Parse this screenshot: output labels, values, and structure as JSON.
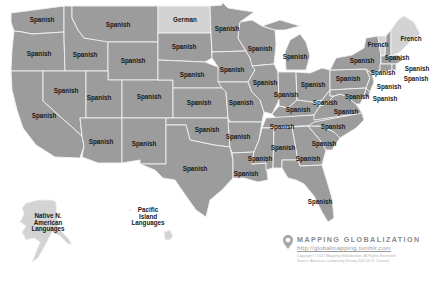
{
  "map": {
    "subject": "Most common language spoken at home other than English, by U.S. state",
    "colors": {
      "spanish_fill": "#9c9c9c",
      "other_fill": "#d3d3d3",
      "border": "#f2f2f2",
      "label": "#1a1a1a"
    },
    "states": [
      {
        "id": "WA",
        "label": "Spanish",
        "x": 42,
        "y": 20
      },
      {
        "id": "OR",
        "label": "Spanish",
        "x": 39,
        "y": 54
      },
      {
        "id": "CA",
        "label": "Spanish",
        "x": 44,
        "y": 116
      },
      {
        "id": "ID",
        "label": "Spanish",
        "x": 85,
        "y": 55
      },
      {
        "id": "NV",
        "label": "Spanish",
        "x": 66,
        "y": 91
      },
      {
        "id": "MT",
        "label": "Spanish",
        "x": 118,
        "y": 25
      },
      {
        "id": "WY",
        "label": "Spanish",
        "x": 133,
        "y": 61
      },
      {
        "id": "UT",
        "label": "Spanish",
        "x": 99,
        "y": 98
      },
      {
        "id": "CO",
        "label": "Spanish",
        "x": 149,
        "y": 97
      },
      {
        "id": "AZ",
        "label": "Spanish",
        "x": 101,
        "y": 142
      },
      {
        "id": "NM",
        "label": "Spanish",
        "x": 144,
        "y": 144
      },
      {
        "id": "ND",
        "label": "German",
        "x": 185,
        "y": 20
      },
      {
        "id": "SD",
        "label": "Spanish",
        "x": 184,
        "y": 47
      },
      {
        "id": "NE",
        "label": "Spanish",
        "x": 192,
        "y": 75
      },
      {
        "id": "KS",
        "label": "Spanish",
        "x": 199,
        "y": 103
      },
      {
        "id": "OK",
        "label": "Spanish",
        "x": 207,
        "y": 130
      },
      {
        "id": "TX",
        "label": "Spanish",
        "x": 195,
        "y": 169
      },
      {
        "id": "MN",
        "label": "Spanish",
        "x": 227,
        "y": 29
      },
      {
        "id": "IA",
        "label": "Spanish",
        "x": 232,
        "y": 70
      },
      {
        "id": "MO",
        "label": "Spanish",
        "x": 241,
        "y": 103
      },
      {
        "id": "AR",
        "label": "Spanish",
        "x": 238,
        "y": 137
      },
      {
        "id": "LA",
        "label": "Spanish",
        "x": 246,
        "y": 174
      },
      {
        "id": "WI",
        "label": "Spanish",
        "x": 260,
        "y": 49
      },
      {
        "id": "IL",
        "label": "Spanish",
        "x": 265,
        "y": 83
      },
      {
        "id": "MI",
        "label": "Spanish",
        "x": 295,
        "y": 57
      },
      {
        "id": "IN",
        "label": "Spanish",
        "x": 286,
        "y": 95
      },
      {
        "id": "OH",
        "label": "Spanish",
        "x": 313,
        "y": 85
      },
      {
        "id": "KY",
        "label": "Spanish",
        "x": 298,
        "y": 110
      },
      {
        "id": "TN",
        "label": "Spanish",
        "x": 282,
        "y": 127
      },
      {
        "id": "MS",
        "label": "Spanish",
        "x": 260,
        "y": 159
      },
      {
        "id": "AL",
        "label": "Spanish",
        "x": 283,
        "y": 148
      },
      {
        "id": "GA",
        "label": "Spanish",
        "x": 308,
        "y": 159
      },
      {
        "id": "FL",
        "label": "Spanish",
        "x": 320,
        "y": 202
      },
      {
        "id": "SC",
        "label": "Spanish",
        "x": 324,
        "y": 144
      },
      {
        "id": "NC",
        "label": "Spanish",
        "x": 333,
        "y": 127
      },
      {
        "id": "VA",
        "label": "Spanish",
        "x": 346,
        "y": 112
      },
      {
        "id": "WV",
        "label": "Spanish",
        "x": 325,
        "y": 103
      },
      {
        "id": "PA",
        "label": "Spanish",
        "x": 348,
        "y": 79
      },
      {
        "id": "NY",
        "label": "Spanish",
        "x": 362,
        "y": 61
      },
      {
        "id": "NY-north",
        "label": "French",
        "x": 378,
        "y": 45
      },
      {
        "id": "VT",
        "label": "French",
        "x": 378,
        "y": 45
      },
      {
        "id": "ME",
        "label": "French",
        "x": 411,
        "y": 39
      },
      {
        "id": "NH",
        "label": "Spanish",
        "x": 397,
        "y": 58
      },
      {
        "id": "MA",
        "label": "Spanish",
        "x": 417,
        "y": 69
      },
      {
        "id": "RI",
        "label": "Spanish",
        "x": 416,
        "y": 79
      },
      {
        "id": "CT",
        "label": "Spanish",
        "x": 383,
        "y": 73
      },
      {
        "id": "NJ",
        "label": "Spanish",
        "x": 389,
        "y": 87
      },
      {
        "id": "DE",
        "label": "Spanish",
        "x": 385,
        "y": 99
      },
      {
        "id": "MD",
        "label": "Spanish",
        "x": 357,
        "y": 97
      },
      {
        "id": "AK",
        "label": "Native N.\nAmerican\nLanguages",
        "x": 48,
        "y": 223
      },
      {
        "id": "HI",
        "label": "Pacific\nIsland\nLanguages",
        "x": 148,
        "y": 217
      }
    ]
  },
  "legend": {
    "icon": "map-pin-icon",
    "brand": "MAPPING GLOBALIZATION",
    "url": "http://globalmapping.tumblr.com",
    "copyright_line1": "Copyright © 2017 Mapping Globalization. All Rights Reserved.",
    "copyright_line2": "Source: American Community Survey 2012 (U.S. Census)"
  }
}
